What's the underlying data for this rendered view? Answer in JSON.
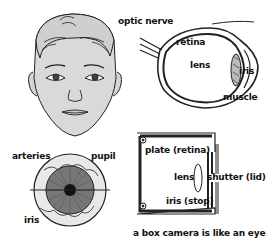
{
  "diagram": {
    "face": {
      "label_optic_nerve": "optic nerve"
    },
    "eye_cross_section": {
      "retina": "retina",
      "lens": "lens",
      "iris": "iris",
      "muscle": "muscle"
    },
    "eye_front": {
      "arteries": "arteries",
      "pupil": "pupil",
      "iris": "iris"
    },
    "box_camera": {
      "plate": "plate (retina)",
      "lens": "lens",
      "shutter": "shutter (lid)",
      "iris": "iris (stop)",
      "caption": "a box camera is like an eye"
    }
  },
  "colors": {
    "ink": "#111111",
    "skin": "#d9d9d9",
    "background": "#ffffff"
  }
}
